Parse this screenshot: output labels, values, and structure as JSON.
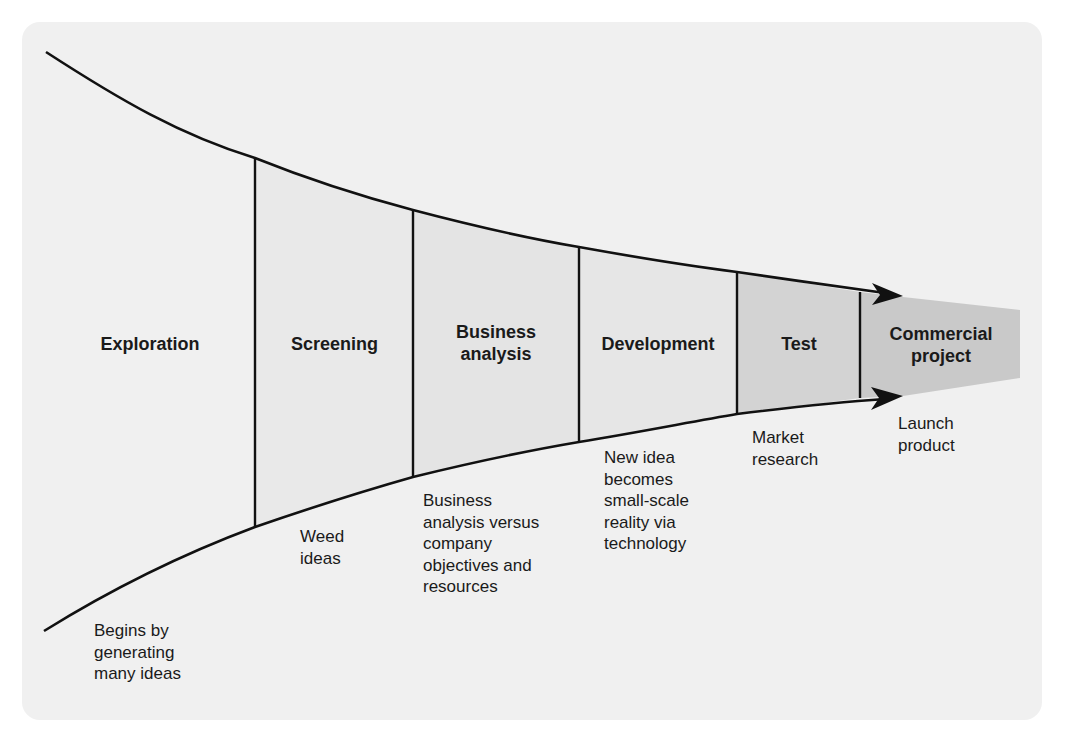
{
  "diagram": {
    "type": "stage-gate funnel",
    "colors": {
      "background_card": "#f0f0f0",
      "stage_light": "#e8e8e8",
      "stage_medium": "#e2e2e2",
      "stage_test": "#d2d2d2",
      "commercial_project": "#c8c8c8",
      "line": "#111111"
    },
    "stages": [
      {
        "title": "Exploration",
        "description": "Begins by\ngenerating\nmany ideas"
      },
      {
        "title": "Screening",
        "description": "Weed\nideas"
      },
      {
        "title": "Business\nanalysis",
        "description": "Business\nanalysis versus\ncompany\nobjectives and\nresources"
      },
      {
        "title": "Development",
        "description": "New idea\nbecomes\nsmall-scale\nreality via\ntechnology"
      },
      {
        "title": "Test",
        "description": "Market\nresearch"
      },
      {
        "title": "Commercial\nproject",
        "description": "Launch\nproduct"
      }
    ]
  }
}
